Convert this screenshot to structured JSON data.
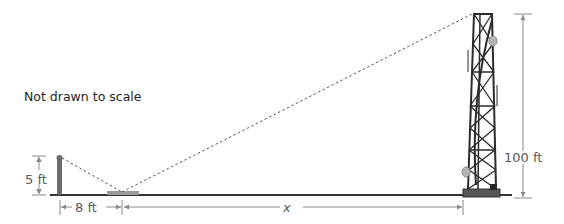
{
  "diagram": {
    "note": "Not drawn to scale",
    "labels": {
      "person_height": "5 ft",
      "person_to_mirror": "8 ft",
      "mirror_to_tower": "x",
      "tower_height": "100 ft"
    },
    "colors": {
      "ground": "#333333",
      "dimension": "#8a8a8a",
      "sightline": "#555555",
      "tower": "#2b2b2b",
      "dish": "#b5b5b5"
    }
  }
}
